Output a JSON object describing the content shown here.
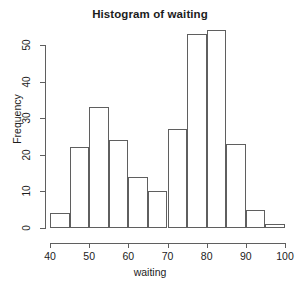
{
  "chart_data": {
    "type": "bar",
    "title": "Histogram of waiting",
    "xlabel": "waiting",
    "ylabel": "Frequency",
    "xlim": [
      40,
      100
    ],
    "ylim": [
      0,
      54
    ],
    "grid": false,
    "legend": null,
    "bin_width": 5,
    "bin_edges": [
      40,
      45,
      50,
      55,
      60,
      65,
      70,
      75,
      80,
      85,
      90,
      95,
      100
    ],
    "categories": [
      "40-45",
      "45-50",
      "50-55",
      "55-60",
      "60-65",
      "65-70",
      "70-75",
      "75-80",
      "80-85",
      "85-90",
      "90-95",
      "95-100"
    ],
    "values": [
      4,
      22,
      33,
      24,
      14,
      10,
      27,
      53,
      54,
      23,
      5,
      1
    ],
    "x_ticks": [
      40,
      50,
      60,
      70,
      80,
      90,
      100
    ],
    "x_tick_labels": [
      "40",
      "50",
      "60",
      "70",
      "80",
      "90",
      "100"
    ],
    "y_ticks": [
      0,
      10,
      20,
      30,
      40,
      50
    ],
    "y_tick_labels": [
      "0",
      "10",
      "20",
      "30",
      "40",
      "50"
    ],
    "bar_border_color": "#5f5f5f",
    "bar_fill_color": "transparent",
    "axis_color": "#5f5f5f",
    "background_color": "#ffffff",
    "text_color": "#1c1c1c"
  }
}
